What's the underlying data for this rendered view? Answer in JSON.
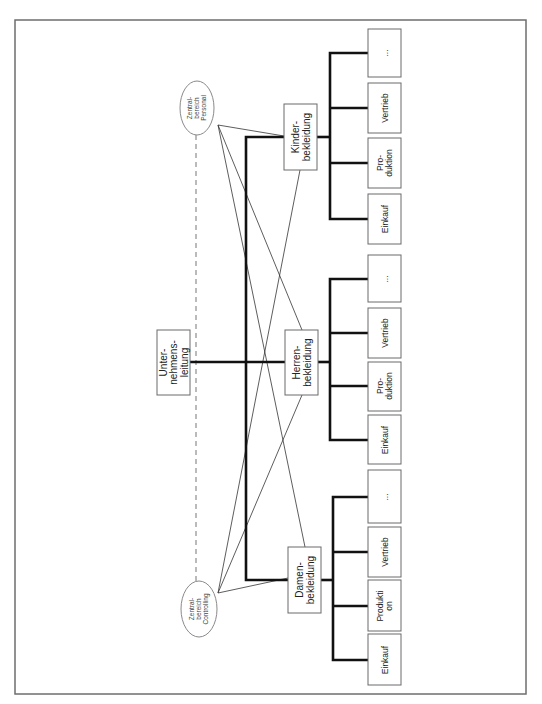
{
  "diagram": {
    "type": "organization-chart",
    "orientation": "rotated-90-ccw",
    "root": {
      "line1": "Unter-",
      "line2": "nehmens-",
      "line3": "leitung"
    },
    "staff_units": {
      "personal": {
        "line1": "Zentral-",
        "line2": "bereich",
        "line3": "Personal"
      },
      "controlling": {
        "line1": "Zentral-",
        "line2": "bereich",
        "line3": "Controlling"
      }
    },
    "divisions": [
      {
        "line1": "Kinder-",
        "line2": "bekleidung",
        "functions": [
          {
            "line1": "Einkauf",
            "line2": ""
          },
          {
            "line1": "Pro-",
            "line2": "duktion"
          },
          {
            "line1": "Vertrieb",
            "line2": ""
          },
          {
            "line1": "...",
            "line2": ""
          }
        ]
      },
      {
        "line1": "Herren-",
        "line2": "bekleidung",
        "functions": [
          {
            "line1": "Einkauf",
            "line2": ""
          },
          {
            "line1": "Pro-",
            "line2": "duktion"
          },
          {
            "line1": "Vertrieb",
            "line2": ""
          },
          {
            "line1": "...",
            "line2": ""
          }
        ]
      },
      {
        "line1": "Damen-",
        "line2": "bekleidung",
        "functions": [
          {
            "line1": "Einkauf",
            "line2": ""
          },
          {
            "line1": "Produkti",
            "line2": "on"
          },
          {
            "line1": "Vertrieb",
            "line2": ""
          },
          {
            "line1": "...",
            "line2": ""
          }
        ]
      }
    ]
  }
}
